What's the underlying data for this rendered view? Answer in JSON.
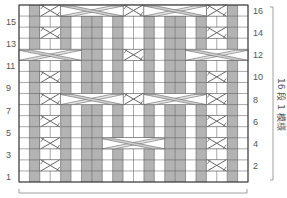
{
  "chart": {
    "title": "",
    "cols": 22,
    "rows": 16,
    "grid": {
      "left": 19,
      "top": 5,
      "right": 248,
      "bottom": 182
    },
    "colors": {
      "purl": "#b3b3b3",
      "knit": "#ffffff",
      "line": "#555555",
      "cable_fill": "#e6e6e6",
      "cable_stroke": "#666666"
    },
    "purl_columns": [
      1,
      4,
      6,
      7,
      9,
      12,
      14,
      15,
      17,
      20
    ],
    "small_crosses": [
      {
        "row": 2,
        "col": 2
      },
      {
        "row": 2,
        "col": 18
      },
      {
        "row": 4,
        "col": 2
      },
      {
        "row": 4,
        "col": 18
      },
      {
        "row": 6,
        "col": 2
      },
      {
        "row": 6,
        "col": 18
      },
      {
        "row": 8,
        "col": 2
      },
      {
        "row": 8,
        "col": 10
      },
      {
        "row": 8,
        "col": 18
      },
      {
        "row": 10,
        "col": 2
      },
      {
        "row": 10,
        "col": 18
      },
      {
        "row": 12,
        "col": 10
      },
      {
        "row": 14,
        "col": 2
      },
      {
        "row": 14,
        "col": 18
      },
      {
        "row": 16,
        "col": 2
      },
      {
        "row": 16,
        "col": 10
      },
      {
        "row": 16,
        "col": 18
      }
    ],
    "large_cables": [
      {
        "row": 4,
        "col": 8,
        "width": 6
      },
      {
        "row": 8,
        "col": 4,
        "width": 6
      },
      {
        "row": 8,
        "col": 12,
        "width": 6
      },
      {
        "row": 12,
        "col": 0,
        "width": 6
      },
      {
        "row": 12,
        "col": 16,
        "width": 6
      },
      {
        "row": 16,
        "col": 4,
        "width": 6
      },
      {
        "row": 16,
        "col": 12,
        "width": 6
      }
    ],
    "left_row_labels": [
      "1",
      "3",
      "5",
      "7",
      "9",
      "11",
      "13",
      "15"
    ],
    "right_row_labels": [
      "2",
      "4",
      "6",
      "8",
      "10",
      "12",
      "14",
      "16"
    ],
    "repeat_label": "16 段 1 模様"
  },
  "chart_data": {
    "type": "table",
    "rows": 16,
    "columns": 22,
    "row_labels_left": [
      1,
      3,
      5,
      7,
      9,
      11,
      13,
      15
    ],
    "row_labels_right": [
      2,
      4,
      6,
      8,
      10,
      12,
      14,
      16
    ],
    "annotation": "16 段 1 模様",
    "purl_columns": [
      1,
      4,
      6,
      7,
      9,
      12,
      14,
      15,
      17,
      20
    ],
    "cable_rows": {
      "small_2st": [
        2,
        4,
        6,
        8,
        10,
        12,
        14,
        16
      ],
      "large_6st": [
        4,
        8,
        12,
        16
      ]
    }
  }
}
